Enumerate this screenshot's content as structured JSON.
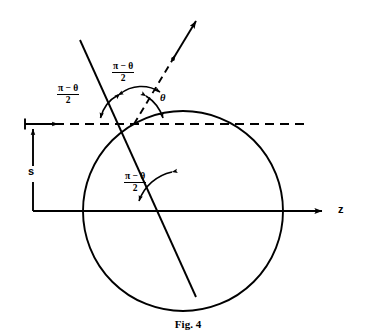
{
  "figure": {
    "caption": "Fig. 4",
    "axis_label_z": "z",
    "impact_parameter_label": "s"
  },
  "angles": [
    {
      "id": "angle-upper-left",
      "numerator": "π − θ",
      "denominator": "2",
      "description": "angle between incoming trajectory and horizontal dashed line, left side"
    },
    {
      "id": "angle-upper-center",
      "numerator": "π − θ",
      "denominator": "2",
      "description": "angle between incoming trajectory and outgoing dashed ray"
    },
    {
      "id": "angle-center-bottom",
      "numerator": "π − θ",
      "denominator": "2",
      "description": "angle at sphere center between z-axis and radius to impact point"
    }
  ],
  "theta": {
    "symbol": "θ",
    "description": "scattering angle between outgoing dashed ray and horizontal dashed line"
  },
  "geometry": {
    "circle": {
      "cx": 183,
      "cy": 211,
      "r": 100
    },
    "z_axis": {
      "x1": 33,
      "y": 211,
      "x2": 330
    },
    "dashed_horizontal": {
      "x1": 33,
      "y": 124,
      "x2": 306
    },
    "impact_point": {
      "x": 134,
      "y": 124
    },
    "incoming_line": {
      "x1": 80,
      "y1": 40,
      "x2": 196,
      "y2": 297
    },
    "outgoing_ray": {
      "x1": 134,
      "y1": 124,
      "x2": 197,
      "y2": 20
    }
  },
  "colors": {
    "stroke": "#000000",
    "background": "#ffffff"
  }
}
